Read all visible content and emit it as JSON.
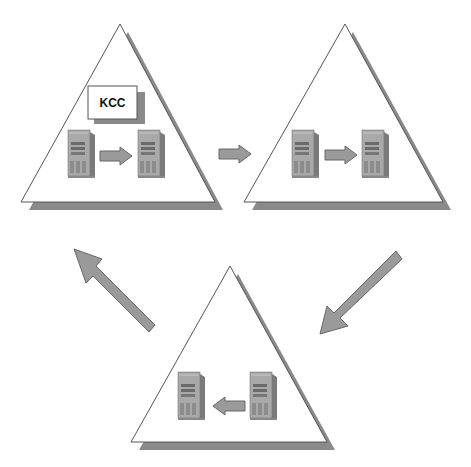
{
  "diagram": {
    "kcc_label": "KCC",
    "colors": {
      "background": "#ffffff",
      "triangle_fill": "#ffffff",
      "triangle_stroke": "#555555",
      "shadow": "#8a8a8a",
      "arrow_fill": "#999999",
      "arrow_stroke": "#666666",
      "server_body": "#a8a8a8",
      "server_dark": "#6f6f6f"
    },
    "sites": [
      {
        "name": "site-1",
        "has_kcc": true,
        "replication_direction": "left-to-right"
      },
      {
        "name": "site-2",
        "has_kcc": false,
        "replication_direction": "left-to-right"
      },
      {
        "name": "site-3",
        "has_kcc": false,
        "replication_direction": "right-to-left"
      }
    ],
    "flow": [
      "site-1 → site-2",
      "site-2 → site-3",
      "site-3 → site-1"
    ]
  }
}
